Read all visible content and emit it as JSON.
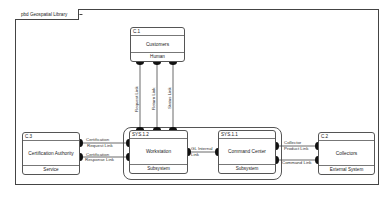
{
  "diagram": {
    "title": "pbd Geospatial Library",
    "blocks": [
      {
        "id": "C.1",
        "name": "Customers",
        "stereotype": "Human"
      },
      {
        "id": "SYS.1.2",
        "name": "Workstation",
        "stereotype": "Subsystem"
      },
      {
        "id": "SYS.1.1",
        "name": "Command Center",
        "stereotype": "Subsystem"
      },
      {
        "id": "C.3",
        "name": "Certification Authority",
        "stereotype": "Service"
      },
      {
        "id": "C.2",
        "name": "Collectors",
        "stereotype": "External System"
      }
    ],
    "links": {
      "request": "Request Link",
      "return": "Return Link",
      "status": "Status Link",
      "cert_request_1": "Certification",
      "cert_request_2": "Request Link",
      "cert_response_1": "Certification",
      "cert_response_2": "Response Link",
      "gl_internal_1": "GL Internal",
      "gl_internal_2": "Link",
      "collector_product_1": "Collector",
      "collector_product_2": "Product Link",
      "command": "Command Link"
    },
    "colors": {
      "line": "#444444",
      "port": "#111111",
      "background": "#ffffff"
    }
  }
}
